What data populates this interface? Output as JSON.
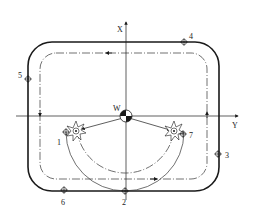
{
  "diagram": {
    "type": "cnc-milling-toolpath",
    "axes": {
      "x_label": "X",
      "y_label": "Y"
    },
    "origin_label": "W",
    "points": [
      {
        "id": "1",
        "label": "1"
      },
      {
        "id": "2",
        "label": "2"
      },
      {
        "id": "3",
        "label": "3"
      },
      {
        "id": "4",
        "label": "4"
      },
      {
        "id": "5",
        "label": "5"
      },
      {
        "id": "6",
        "label": "6"
      },
      {
        "id": "7",
        "label": "7"
      }
    ],
    "colors": {
      "line": "#1a1a1a",
      "background": "#ffffff"
    }
  }
}
